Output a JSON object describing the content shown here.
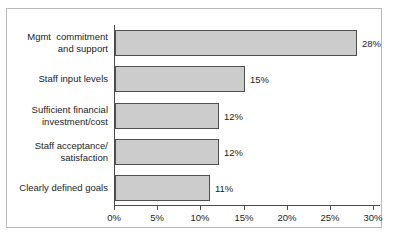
{
  "chart_data": {
    "type": "bar",
    "orientation": "horizontal",
    "title": "",
    "xlabel": "",
    "ylabel": "",
    "categories": [
      "Mgmt  commitment\nand support",
      "Staff input levels",
      "Sufficient financial\ninvestment/cost",
      "Staff acceptance/\nsatisfaction",
      "Clearly defined goals"
    ],
    "values": [
      28,
      15,
      12,
      12,
      11
    ],
    "value_labels": [
      "28%",
      "15%",
      "12%",
      "12%",
      "11%"
    ],
    "xlim": [
      0,
      30
    ],
    "xticks": [
      0,
      5,
      10,
      15,
      20,
      25,
      30
    ],
    "xtick_labels": [
      "0%",
      "5%",
      "10%",
      "15%",
      "20%",
      "25%",
      "30%"
    ],
    "grid": false,
    "legend": false,
    "bar_color": "#cccccc",
    "bar_border_color": "#4f4f4f",
    "axis_color": "#4a4a4a",
    "text_color": "#1d1d1d",
    "frame_color": "#b9b9b9",
    "background": "#ffffff"
  }
}
